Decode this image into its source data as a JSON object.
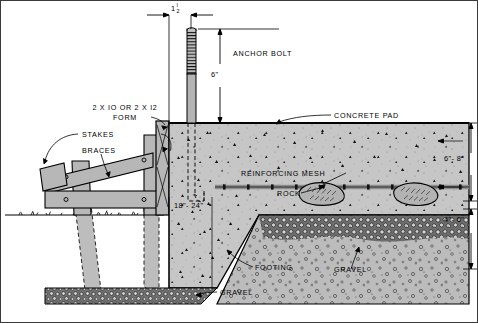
{
  "drawing": {
    "title": "Concrete Pad and Footing Section Detail",
    "type": "construction-section-detail"
  },
  "labels": {
    "anchor_bolt": "ANCHOR BOLT",
    "form": "2 X IO OR 2 X I2",
    "form2": "FORM",
    "stakes": "STAKES",
    "braces": "BRACES",
    "concrete_pad": "CONCRETE PAD",
    "reinforcing_mesh": "REINFORCING MESH",
    "rock": "ROCK",
    "footing": "FOOTING",
    "gravel_bottom": "GRAVEL",
    "gravel_right": "GRAVEL"
  },
  "dimensions": {
    "bolt_offset_whole": "1",
    "bolt_offset_num": "I",
    "bolt_offset_den": "2",
    "bolt_offset_inch": "\"",
    "bolt_exposed": "6\"",
    "pad_thickness": "6\"- 8\"",
    "gravel_depth": "4\"- 6\"",
    "footing_width": "18\"- 24\""
  },
  "colors": {
    "concrete": "#c6c6c6",
    "lumber": "#b9b9b9",
    "gravel": "#bdbdbd",
    "rock_bed": "#8f8f8f",
    "line": "#000000",
    "background": "#ffffff",
    "mesh": "#8a8a8a"
  }
}
